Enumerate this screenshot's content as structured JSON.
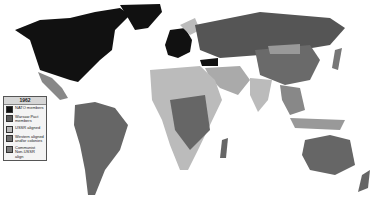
{
  "map": {
    "title": "1962",
    "legend": [
      {
        "label": "NATO members",
        "color": "#111111"
      },
      {
        "label": "Warsaw Pact members",
        "color": "#5a5a5a"
      },
      {
        "label": "USSR aligned",
        "color": "#b8b8b8"
      },
      {
        "label": "Western aligned and/or colonies",
        "color": "#6e6e6e"
      },
      {
        "label": "Communist Non-USSR align",
        "color": "#7c7c7c"
      }
    ]
  }
}
